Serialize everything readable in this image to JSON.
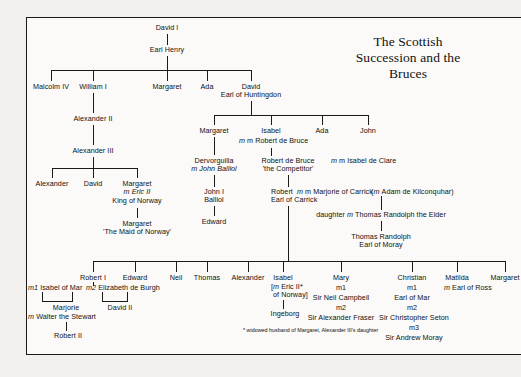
{
  "title": {
    "line1": "The Scottish Succession",
    "line2": "and the Bruces"
  },
  "footnote": {
    "line1": "* widowed husband of Margaret,",
    "line2": "Alexander III's daughter"
  },
  "nodes": {
    "david_i": "David I",
    "earl_henry": "Earl Henry",
    "malcolm_iv": "Malcolm IV",
    "william_i": "William I",
    "margaret_1": "Margaret",
    "ada_1": "Ada",
    "david_huntingdon_l1": "David",
    "david_huntingdon_l2": "Earl of Huntingdon",
    "alexander_ii": "Alexander II",
    "alexander_iii": "Alexander III",
    "alexander_son": "Alexander",
    "david_son": "David",
    "margaret_norway_l1": "Margaret",
    "margaret_norway_l2": "m Eric II",
    "margaret_norway_l3": "King of Norway",
    "maid_l1": "Margaret",
    "maid_l2": "'The Maid of Norway'",
    "margaret_hunt": "Margaret",
    "isabel_hunt": "Isabel",
    "isabel_m": "m Robert de Bruce",
    "ada_2": "Ada",
    "john_hunt": "John",
    "dervorguilla_l1": "Dervorguilla",
    "dervorguilla_l2": "m John Balliol",
    "robert_competitor_l1": "Robert de Bruce",
    "robert_competitor_l2": "'the Competitor'",
    "isabel_de_clare": "m Isabel de Clare",
    "john_balliol_l1": "John I",
    "john_balliol_l2": "Balliol",
    "edward_balliol": "Edward",
    "robert_carrick_l1": "Robert",
    "robert_carrick_l2": "Earl of Carrick",
    "marjorie_carrick": "m Marjorie of Carrick",
    "adam_kilconquhar": "(m Adam de Kilconquhar)",
    "daughter_randolph": "daughter m Thomas Randolph the Elder",
    "thomas_randolph_l1": "Thomas Randolph",
    "thomas_randolph_l2": "Earl of Moray",
    "robert_i": "Robert I",
    "robert_i_m1": "m1 Isabel of Mar",
    "robert_i_m2": "m2 Elizabeth de Burgh",
    "marjorie_l1": "Marjorie",
    "marjorie_l2": "m Walter the Stewart",
    "robert_ii": "Robert II",
    "david_ii": "David II",
    "edward_bruce": "Edward",
    "neil_bruce": "Neil",
    "thomas_bruce": "Thomas",
    "alexander_bruce": "Alexander",
    "isabel_bruce_l1": "Isabel",
    "isabel_bruce_l2": "[m Eric II*",
    "isabel_bruce_l3": "of Norway]",
    "ingeborg": "Ingeborg",
    "mary_l1": "Mary",
    "mary_m1": "m1",
    "mary_h1": "Sir Neil Campbell",
    "mary_m2": "m2",
    "mary_h2": "Sir Alexander Fraser",
    "christian_l1": "Christian",
    "christian_m1": "m1",
    "christian_h1": "Earl of Mar",
    "christian_m2": "m2",
    "christian_h2": "Sir Christopher Seton",
    "christian_m3": "m3",
    "christian_h3": "Sir Andrew Moray",
    "matilda": "Matilda",
    "matilda_m": "m Earl of Ross",
    "margaret_last": "Margaret"
  },
  "colors": {
    "ink": "#1a1a1a",
    "page": "#fbfaf8",
    "backdrop": "#f2f0ed"
  }
}
